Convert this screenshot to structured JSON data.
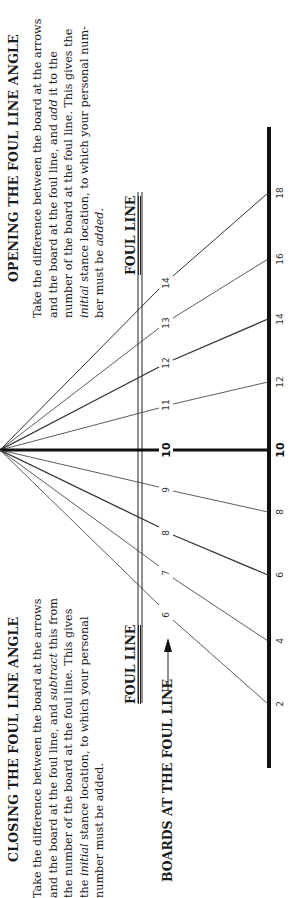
{
  "opening": {
    "title": "OPENING THE FOUL LINE ANGLE",
    "lines": [
      "Take the difference between the board at the arrows",
      "and the board at the foul line, and add it to the",
      "number of the board at the foul line. This gives the",
      "initial stance location, to which your personal num-",
      "ber must be added."
    ]
  },
  "closing": {
    "title": "CLOSING THE FOUL LINE ANGLE",
    "lines": [
      "Take the difference between the board at the arrows",
      "and the board at the foul line, and subtract this from",
      "the number of the board at the foul line. This gives",
      "the initial stance location, to which your personal",
      "number must be added."
    ]
  },
  "labels": {
    "foul_line_top": "FOUL LINE",
    "foul_line_bottom": "FOUL LINE",
    "boards_at_foul_line": "BOARDS AT THE FOUL LINE"
  },
  "diagram": {
    "arrow_boards": [
      "14",
      "13",
      "12",
      "11",
      "10",
      "9",
      "8",
      "7",
      "6"
    ],
    "foul_line_boards": [
      "18",
      "16",
      "14",
      "12",
      "10",
      "8",
      "6",
      "4",
      "2"
    ],
    "rays": [
      {
        "arrow": "14",
        "foul": "18"
      },
      {
        "arrow": "13",
        "foul": "16"
      },
      {
        "arrow": "12",
        "foul": "14"
      },
      {
        "arrow": "11",
        "foul": "12"
      },
      {
        "arrow": "10",
        "foul": "10"
      },
      {
        "arrow": "9",
        "foul": "8"
      },
      {
        "arrow": "8",
        "foul": "6"
      },
      {
        "arrow": "7",
        "foul": "4"
      },
      {
        "arrow": "6",
        "foul": "2"
      }
    ],
    "colors": {
      "ink": "#1a1a1a",
      "thin": "#444444"
    }
  }
}
